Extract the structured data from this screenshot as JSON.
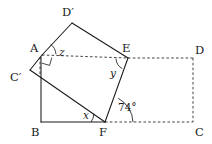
{
  "figure": {
    "type": "geometry-diagram",
    "canvas": {
      "width": 212,
      "height": 144
    },
    "colors": {
      "solid_line": "#1a1a1a",
      "dashed_line": "#3a3a3a",
      "background": "#ffffff",
      "text": "#1a1a1a"
    }
  },
  "vertices": [
    {
      "id": "A",
      "label": "A",
      "x": 42,
      "y": 55,
      "label_x": 30,
      "label_y": 52
    },
    {
      "id": "B",
      "label": "B",
      "x": 41,
      "y": 122,
      "label_x": 31,
      "label_y": 136
    },
    {
      "id": "C",
      "label": "C",
      "x": 193,
      "y": 122,
      "label_x": 195,
      "label_y": 136
    },
    {
      "id": "D",
      "label": "D",
      "x": 193,
      "y": 58,
      "label_x": 195,
      "label_y": 54
    },
    {
      "id": "E",
      "label": "E",
      "x": 128,
      "y": 58,
      "label_x": 124,
      "label_y": 52
    },
    {
      "id": "F",
      "label": "F",
      "x": 105,
      "y": 122,
      "label_x": 100,
      "label_y": 136
    },
    {
      "id": "Cp",
      "label": "C′",
      "x": 40,
      "y": 76,
      "label_x": 12,
      "label_y": 81
    },
    {
      "id": "Dp",
      "label": "D′",
      "x": 72,
      "y": 23,
      "label_x": 63,
      "label_y": 16
    }
  ],
  "solid_edges": [
    {
      "name": "edge-A-Dprime",
      "from": "A",
      "to": "Dp"
    },
    {
      "name": "edge-Dprime-E",
      "from": "Dp",
      "to": "E"
    },
    {
      "name": "edge-E-F",
      "from": "E",
      "to": "F"
    },
    {
      "name": "edge-A-Cprime",
      "from": "A",
      "to": "Cp"
    },
    {
      "name": "edge-Cprime-F",
      "from": "Cp",
      "to": "F"
    },
    {
      "name": "edge-B-F",
      "from": "B",
      "to": "F"
    },
    {
      "name": "edge-A-B",
      "from": "A",
      "to": "B"
    }
  ],
  "dashed_edges": [
    {
      "name": "edge-A-E",
      "from": "A",
      "to": "E"
    },
    {
      "name": "edge-E-D",
      "from": "E",
      "to": "D"
    },
    {
      "name": "edge-D-C",
      "from": "D",
      "to": "C"
    },
    {
      "name": "edge-F-C",
      "from": "F",
      "to": "C"
    }
  ],
  "angles": [
    {
      "id": "z",
      "label": "z",
      "kind": "unknown",
      "at_vertex": "A",
      "label_x": 59,
      "label_y": 56,
      "arc": "M 56 54.3 A 14 14 0 0 0 50.6 44.2"
    },
    {
      "id": "y",
      "label": "y",
      "kind": "unknown",
      "at_vertex": "E",
      "label_x": 111,
      "label_y": 76,
      "arc": "M 116 58 A 12 12 0 0 0 122.3 68.6"
    },
    {
      "id": "x",
      "label": "x",
      "kind": "unknown",
      "at_vertex": "F",
      "label_x": 84,
      "label_y": 119,
      "arc": "M 91 122 A 14 14 0 0 0 93.6 113.9"
    },
    {
      "id": "angle74",
      "label": "74°",
      "kind": "measured",
      "at_vertex": "F",
      "label_x": 119,
      "label_y": 111,
      "arc": "M 133 122 A 28 28 0 0 0 118.6 98.1"
    }
  ],
  "right_angle_marks": [
    {
      "id": "right-angle-at-A",
      "at_vertex": "A",
      "path": "M 42 63.2 L 49.6 65.4 L 51.8 57.6"
    }
  ]
}
